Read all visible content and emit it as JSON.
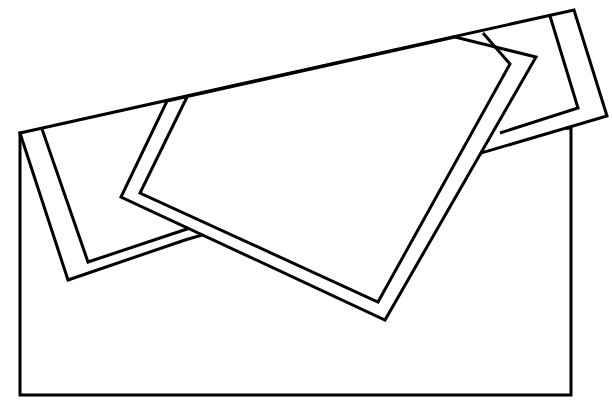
{
  "figure": {
    "stroke_color": "#000000",
    "background_color": "#ffffff"
  }
}
